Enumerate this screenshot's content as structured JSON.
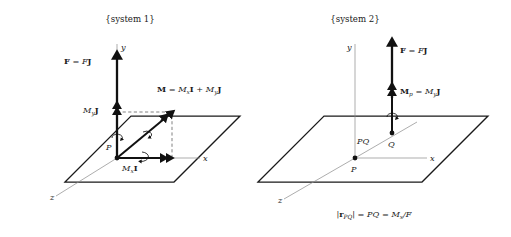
{
  "figure": {
    "caption_bottom": "|r_PQ| = PQ = M_x/F",
    "systems": [
      {
        "id": "system-1",
        "title": "{system 1}",
        "axes": [
          {
            "name": "y-axis",
            "label": "y"
          },
          {
            "name": "x-axis",
            "label": "x"
          },
          {
            "name": "z-axis",
            "label": "z"
          }
        ],
        "points": [
          {
            "name": "point-p",
            "label": "P"
          }
        ],
        "vectors": [
          {
            "name": "force-vector",
            "label_parts": [
              "F",
              " = ",
              "F",
              "J"
            ],
            "label_plain": "F = FJ"
          },
          {
            "name": "moment-resultant-vector",
            "label_plain": "M = M_x I + M_y J"
          },
          {
            "name": "moment-y-component-vector",
            "label_plain": "M_y J"
          },
          {
            "name": "moment-x-component-vector",
            "label_plain": "M_x I"
          }
        ]
      },
      {
        "id": "system-2",
        "title": "{system 2}",
        "axes": [
          {
            "name": "y-axis",
            "label": "y"
          },
          {
            "name": "x-axis",
            "label": "x"
          },
          {
            "name": "z-axis",
            "label": "z"
          }
        ],
        "points": [
          {
            "name": "point-p",
            "label": "P"
          },
          {
            "name": "point-q",
            "label": "Q"
          }
        ],
        "segments": [
          {
            "name": "segment-pq",
            "label": "PQ"
          }
        ],
        "vectors": [
          {
            "name": "force-vector",
            "label_plain": "F = FJ"
          },
          {
            "name": "moment-p-vector",
            "label_plain": "M_p = M_y J"
          }
        ]
      }
    ],
    "symbols": {
      "M": "M",
      "F": "F",
      "P": "P",
      "Q": "Q",
      "PQ": "PQ",
      "I": "I",
      "J": "J",
      "r": "r",
      "x": "x",
      "y": "y",
      "z": "z",
      "sub_x": "x",
      "sub_y": "y",
      "sub_p": "p",
      "sub_PQ": "PQ",
      "eq": "=",
      "plus": "+",
      "slash": "/",
      "bar": "|"
    },
    "colors": {
      "ink": "#111111",
      "axis_gray": "#8a8a8a",
      "dashed_gray": "#4a4a4a",
      "background": "#ffffff"
    }
  }
}
